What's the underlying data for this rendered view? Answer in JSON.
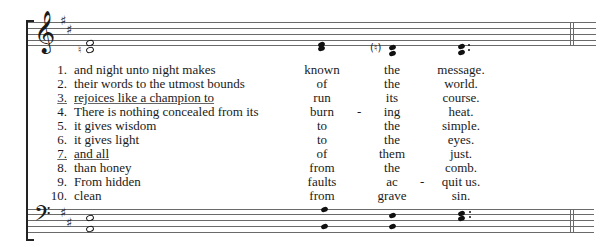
{
  "score": {
    "key_signature": "D major (2 sharps)",
    "treble_staff": {
      "clef": "𝄞",
      "sharps": [
        "♯",
        "♯"
      ],
      "natural_accidental": "♮",
      "bracketed_natural": "(♮)"
    },
    "bass_staff": {
      "clef": "𝄢",
      "sharps": [
        "♯",
        "♯"
      ]
    },
    "colors": {
      "ink": "#1a1a1a",
      "staff": "#6a6a6a",
      "background": "#ffffff"
    }
  },
  "verses": [
    {
      "num": "1.",
      "text": "and night unto night makes",
      "w1": "known",
      "w2": "the",
      "w3": "message.",
      "hyphen1": false,
      "hyphen2": false,
      "underline": false
    },
    {
      "num": "2.",
      "text": "their words to the utmost bounds",
      "w1": "of",
      "w2": "the",
      "w3": "world.",
      "hyphen1": false,
      "hyphen2": false,
      "underline": false
    },
    {
      "num": "3.",
      "text": "rejoices like a champion to",
      "w1": "run",
      "w2": "its",
      "w3": "course.",
      "hyphen1": false,
      "hyphen2": false,
      "underline": true
    },
    {
      "num": "4.",
      "text": "There is nothing concealed from its",
      "w1": "burn",
      "w2": "ing",
      "w3": "heat.",
      "hyphen1": true,
      "hyphen2": false,
      "underline": false
    },
    {
      "num": "5.",
      "text": "it gives wisdom",
      "w1": "to",
      "w2": "the",
      "w3": "simple.",
      "hyphen1": false,
      "hyphen2": false,
      "underline": false
    },
    {
      "num": "6.",
      "text": "it gives light",
      "w1": "to",
      "w2": "the",
      "w3": "eyes.",
      "hyphen1": false,
      "hyphen2": false,
      "underline": false
    },
    {
      "num": "7.",
      "text": "and all",
      "w1": "of",
      "w2": "them",
      "w3": "just.",
      "hyphen1": false,
      "hyphen2": false,
      "underline": true
    },
    {
      "num": "8.",
      "text": "than honey",
      "w1": "from",
      "w2": "the",
      "w3": "comb.",
      "hyphen1": false,
      "hyphen2": false,
      "underline": false
    },
    {
      "num": "9.",
      "text": "From hidden",
      "w1": "faults",
      "w2": "ac",
      "w3": "quit us.",
      "hyphen1": false,
      "hyphen2": true,
      "underline": false
    },
    {
      "num": "10.",
      "text": "clean",
      "w1": "from",
      "w2": "grave",
      "w3": "sin.",
      "hyphen1": false,
      "hyphen2": false,
      "underline": false
    }
  ],
  "hyphen": "-"
}
